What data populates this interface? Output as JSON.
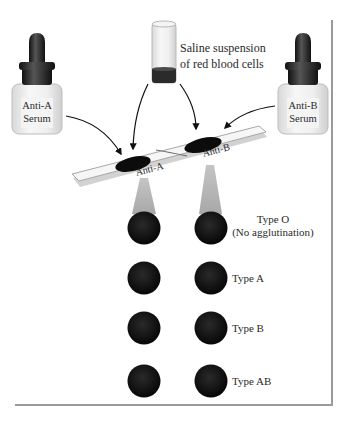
{
  "figure": {
    "reagents": {
      "left_bottle": {
        "line1": "Anti-A",
        "line2": "Serum"
      },
      "right_bottle": {
        "line1": "Anti-B",
        "line2": "Serum"
      },
      "vial": {
        "line1": "Saline suspension",
        "line2": "of red blood cells"
      }
    },
    "slide": {
      "left_well_label": "Anti-A",
      "right_well_label": "Anti-B"
    },
    "results": [
      {
        "label": "Type O",
        "sublabel": "(No agglutination)"
      },
      {
        "label": "Type A",
        "sublabel": ""
      },
      {
        "label": "Type B",
        "sublabel": ""
      },
      {
        "label": "Type AB",
        "sublabel": ""
      }
    ],
    "colors": {
      "dot": "#111111",
      "frame": "#9a9a9a",
      "cone": "#b4b4b4",
      "blood": "#2b2b2b"
    }
  }
}
